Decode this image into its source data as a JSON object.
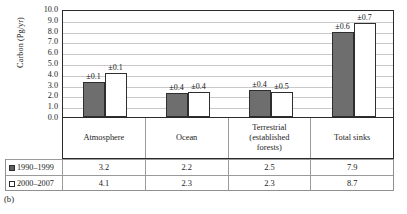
{
  "caption": "(b)",
  "chart_data": {
    "type": "bar",
    "title": "",
    "xlabel": "",
    "ylabel": "Carbon (Pg/yr)",
    "ylim": [
      0.0,
      10.0
    ],
    "ytick_step": 1.0,
    "yticks": [
      "10.0",
      "9.0",
      "8.0",
      "7.0",
      "6.0",
      "5.0",
      "4.0",
      "3.0",
      "2.0",
      "1.0",
      "0.0"
    ],
    "grid": true,
    "legend_position": "table-below",
    "categories": [
      "Atmosphere",
      "Ocean",
      "Terrestrial (established forests)",
      "Total sinks"
    ],
    "series": [
      {
        "name": "1990–1999",
        "marker": "filled-square",
        "color": "#6e6e6e",
        "values": [
          3.2,
          2.2,
          2.5,
          7.9
        ],
        "errors": [
          "±0.1",
          "±0.4",
          "±0.4",
          "±0.6"
        ],
        "value_labels": [
          "3.2",
          "2.2",
          "2.5",
          "7.9"
        ]
      },
      {
        "name": "2000–2007",
        "marker": "open-square",
        "color": "#ffffff",
        "values": [
          4.1,
          2.3,
          2.3,
          8.7
        ],
        "errors": [
          "±0.1",
          "±0.4",
          "±0.5",
          "±0.7"
        ],
        "value_labels": [
          "4.1",
          "2.3",
          "2.3",
          "8.7"
        ]
      }
    ]
  },
  "category_lines": [
    [
      "Atmosphere"
    ],
    [
      "Ocean"
    ],
    [
      "Terrestrial",
      "(established",
      "forests)"
    ],
    [
      "Total sinks"
    ]
  ]
}
